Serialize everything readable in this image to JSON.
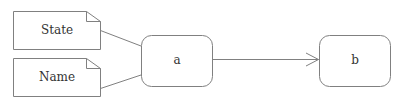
{
  "diagram": {
    "type": "uml-state-diagram",
    "stroke_color": "#808080",
    "text_color": "#333333",
    "background": "#ffffff",
    "notes": [
      {
        "id": "note-state",
        "label": "State"
      },
      {
        "id": "note-name",
        "label": "Name"
      }
    ],
    "states": [
      {
        "id": "state-a",
        "label": "a"
      },
      {
        "id": "state-b",
        "label": "b"
      }
    ],
    "connections": [
      {
        "from": "note-state",
        "to": "state-a",
        "style": "plain-line"
      },
      {
        "from": "note-name",
        "to": "state-a",
        "style": "plain-line"
      },
      {
        "from": "state-a",
        "to": "state-b",
        "style": "open-arrow"
      }
    ]
  }
}
